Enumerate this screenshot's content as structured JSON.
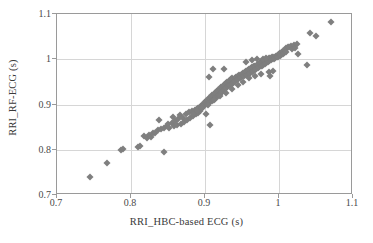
{
  "chart_data": {
    "type": "scatter",
    "title": "",
    "xlabel": "RRI_HBC-based ECG (s)",
    "ylabel": "RRI_RF-ECG (s)",
    "xlim": [
      0.7,
      1.1
    ],
    "ylim": [
      0.7,
      1.1
    ],
    "xticks": [
      "0.7",
      "0.8",
      "0.9",
      "1",
      "1.1"
    ],
    "yticks": [
      "0.7",
      "0.8",
      "0.9",
      "1",
      "1.1"
    ],
    "xtick_values": [
      0.7,
      0.8,
      0.9,
      1.0,
      1.1
    ],
    "ytick_values": [
      0.7,
      0.8,
      0.9,
      1.0,
      1.1
    ],
    "grid": true,
    "legend": null,
    "marker": "diamond",
    "marker_color": "#7f7f7f",
    "frame_color": "#9a9a9a",
    "gridline_color": "#d6d6d6",
    "background_color": "#ffffff",
    "series": [
      {
        "name": "RRI pairs",
        "points": [
          [
            0.744,
            0.739
          ],
          [
            0.767,
            0.77
          ],
          [
            0.787,
            0.799
          ],
          [
            0.789,
            0.802
          ],
          [
            0.809,
            0.807
          ],
          [
            0.812,
            0.808
          ],
          [
            0.818,
            0.83
          ],
          [
            0.821,
            0.826
          ],
          [
            0.824,
            0.833
          ],
          [
            0.827,
            0.828
          ],
          [
            0.83,
            0.838
          ],
          [
            0.833,
            0.836
          ],
          [
            0.836,
            0.843
          ],
          [
            0.838,
            0.866
          ],
          [
            0.841,
            0.846
          ],
          [
            0.844,
            0.794
          ],
          [
            0.845,
            0.849
          ],
          [
            0.848,
            0.852
          ],
          [
            0.85,
            0.857
          ],
          [
            0.852,
            0.848
          ],
          [
            0.855,
            0.86
          ],
          [
            0.857,
            0.872
          ],
          [
            0.858,
            0.852
          ],
          [
            0.86,
            0.864
          ],
          [
            0.862,
            0.855
          ],
          [
            0.864,
            0.868
          ],
          [
            0.866,
            0.876
          ],
          [
            0.868,
            0.858
          ],
          [
            0.87,
            0.871
          ],
          [
            0.872,
            0.862
          ],
          [
            0.874,
            0.88
          ],
          [
            0.876,
            0.866
          ],
          [
            0.878,
            0.884
          ],
          [
            0.88,
            0.87
          ],
          [
            0.882,
            0.886
          ],
          [
            0.884,
            0.874
          ],
          [
            0.886,
            0.888
          ],
          [
            0.888,
            0.878
          ],
          [
            0.889,
            0.891
          ],
          [
            0.89,
            0.882
          ],
          [
            0.891,
            0.893
          ],
          [
            0.893,
            0.886
          ],
          [
            0.894,
            0.896
          ],
          [
            0.895,
            0.89
          ],
          [
            0.896,
            0.899
          ],
          [
            0.897,
            0.894
          ],
          [
            0.898,
            0.902
          ],
          [
            0.899,
            0.898
          ],
          [
            0.9,
            0.905
          ],
          [
            0.901,
            0.879
          ],
          [
            0.902,
            0.908
          ],
          [
            0.903,
            0.901
          ],
          [
            0.904,
            0.911
          ],
          [
            0.905,
            0.904
          ],
          [
            0.906,
            0.914
          ],
          [
            0.907,
            0.855
          ],
          [
            0.908,
            0.917
          ],
          [
            0.909,
            0.907
          ],
          [
            0.91,
            0.92
          ],
          [
            0.911,
            0.91
          ],
          [
            0.912,
            0.923
          ],
          [
            0.913,
            0.913
          ],
          [
            0.914,
            0.926
          ],
          [
            0.915,
            0.916
          ],
          [
            0.905,
            0.961
          ],
          [
            0.911,
            0.978
          ],
          [
            0.916,
            0.929
          ],
          [
            0.917,
            0.919
          ],
          [
            0.918,
            0.932
          ],
          [
            0.919,
            0.922
          ],
          [
            0.92,
            0.935
          ],
          [
            0.921,
            0.925
          ],
          [
            0.922,
            0.938
          ],
          [
            0.923,
            0.928
          ],
          [
            0.924,
            0.941
          ],
          [
            0.925,
            0.931
          ],
          [
            0.926,
            0.944
          ],
          [
            0.927,
            0.934
          ],
          [
            0.928,
            0.947
          ],
          [
            0.926,
            0.979
          ],
          [
            0.929,
            0.937
          ],
          [
            0.93,
            0.95
          ],
          [
            0.931,
            0.94
          ],
          [
            0.932,
            0.953
          ],
          [
            0.933,
            0.943
          ],
          [
            0.934,
            0.944
          ],
          [
            0.935,
            0.956
          ],
          [
            0.936,
            0.946
          ],
          [
            0.937,
            0.958
          ],
          [
            0.938,
            0.948
          ],
          [
            0.939,
            0.95
          ],
          [
            0.94,
            0.959
          ],
          [
            0.941,
            0.952
          ],
          [
            0.942,
            0.961
          ],
          [
            0.943,
            0.954
          ],
          [
            0.944,
            0.963
          ],
          [
            0.945,
            0.956
          ],
          [
            0.946,
            0.965
          ],
          [
            0.947,
            0.958
          ],
          [
            0.948,
            0.966
          ],
          [
            0.949,
            0.96
          ],
          [
            0.95,
            0.968
          ],
          [
            0.951,
            0.962
          ],
          [
            0.952,
            0.97
          ],
          [
            0.953,
            0.963
          ],
          [
            0.954,
            0.972
          ],
          [
            0.955,
            0.965
          ],
          [
            0.956,
            0.974
          ],
          [
            0.957,
            0.966
          ],
          [
            0.958,
            0.976
          ],
          [
            0.959,
            0.968
          ],
          [
            0.96,
            0.978
          ],
          [
            0.961,
            0.97
          ],
          [
            0.962,
            0.98
          ],
          [
            0.963,
            0.972
          ],
          [
            0.964,
            0.982
          ],
          [
            0.965,
            0.974
          ],
          [
            0.966,
            0.984
          ],
          [
            0.967,
            0.976
          ],
          [
            0.968,
            0.986
          ],
          [
            0.969,
            0.978
          ],
          [
            0.97,
            0.988
          ],
          [
            0.971,
            0.98
          ],
          [
            0.972,
            0.99
          ],
          [
            0.973,
            0.982
          ],
          [
            0.974,
            0.992
          ],
          [
            0.975,
            0.984
          ],
          [
            0.976,
            0.994
          ],
          [
            0.977,
            0.986
          ],
          [
            0.978,
            0.996
          ],
          [
            0.979,
            0.988
          ],
          [
            0.98,
            0.998
          ],
          [
            0.981,
            0.99
          ],
          [
            0.982,
            1.0
          ],
          [
            0.983,
            0.992
          ],
          [
            0.984,
            1.001
          ],
          [
            0.985,
            0.994
          ],
          [
            0.986,
            1.002
          ],
          [
            0.987,
            0.996
          ],
          [
            0.988,
            1.003
          ],
          [
            0.989,
            0.998
          ],
          [
            0.99,
            1.004
          ],
          [
            0.991,
            1.0
          ],
          [
            0.992,
            1.005
          ],
          [
            0.993,
            1.001
          ],
          [
            0.994,
            1.006
          ],
          [
            0.995,
            1.002
          ],
          [
            0.996,
            1.008
          ],
          [
            0.997,
            1.004
          ],
          [
            0.998,
            1.01
          ],
          [
            0.999,
            1.006
          ],
          [
            1.0,
            1.012
          ],
          [
            0.988,
            0.962
          ],
          [
            1.001,
            1.008
          ],
          [
            1.002,
            1.014
          ],
          [
            1.003,
            1.01
          ],
          [
            1.004,
            1.016
          ],
          [
            1.005,
            1.012
          ],
          [
            1.006,
            1.018
          ],
          [
            1.007,
            1.014
          ],
          [
            1.008,
            1.02
          ],
          [
            1.009,
            1.024
          ],
          [
            1.01,
            1.016
          ],
          [
            1.012,
            1.026
          ],
          [
            1.014,
            1.028
          ],
          [
            1.016,
            1.03
          ],
          [
            1.018,
            1.022
          ],
          [
            1.02,
            1.032
          ],
          [
            1.022,
            1.025
          ],
          [
            1.024,
            1.034
          ],
          [
            1.026,
            1.012
          ],
          [
            1.038,
            0.988
          ],
          [
            1.042,
            1.058
          ],
          [
            1.05,
            1.052
          ],
          [
            1.07,
            1.082
          ],
          [
            0.955,
            0.995
          ],
          [
            0.963,
            0.998
          ],
          [
            0.97,
            1.0
          ],
          [
            0.978,
            1.001
          ],
          [
            0.983,
            1.003
          ],
          [
            0.986,
            0.972
          ],
          [
            0.992,
            0.975
          ],
          [
            0.975,
            0.968
          ],
          [
            0.968,
            0.964
          ],
          [
            0.96,
            0.958
          ],
          [
            0.952,
            0.95
          ],
          [
            0.944,
            0.942
          ],
          [
            0.936,
            0.934
          ],
          [
            0.928,
            0.926
          ],
          [
            0.92,
            0.918
          ],
          [
            0.912,
            0.909
          ],
          [
            0.904,
            0.9
          ],
          [
            0.896,
            0.892
          ],
          [
            0.889,
            0.885
          ],
          [
            0.884,
            0.88
          ]
        ]
      }
    ]
  }
}
